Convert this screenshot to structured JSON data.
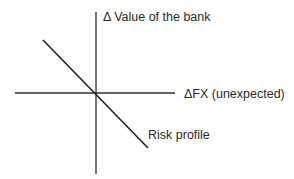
{
  "diagram": {
    "type": "risk-profile",
    "y_axis_label": "Δ Value of the bank",
    "x_axis_label": "ΔFX (unexpected)",
    "line_label": "Risk profile",
    "colors": {
      "axis": "#2f2f2f",
      "line": "#222222",
      "text": "#2a2a2a",
      "background": "#ffffff"
    },
    "geometry": {
      "origin": [
        95,
        93
      ],
      "x_axis": {
        "x1": 15,
        "y1": 93,
        "x2": 175,
        "y2": 93
      },
      "y_axis": {
        "x1": 96,
        "y1": 12,
        "x2": 96,
        "y2": 174
      },
      "risk_line": {
        "x1": 43,
        "y1": 40,
        "x2": 148,
        "y2": 148
      }
    },
    "relationship": "negative slope: value of the bank decreases as FX rises unexpectedly"
  }
}
